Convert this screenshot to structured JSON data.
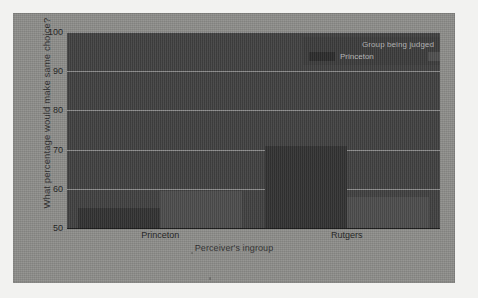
{
  "chart_data": {
    "type": "bar",
    "title": "",
    "xlabel": "Perceiver's ingroup",
    "ylabel": "What percentage would make same choice?",
    "categories": [
      "Princeton",
      "Rutgers"
    ],
    "series": [
      {
        "name": "Princeton",
        "values": [
          55,
          71
        ],
        "color": "#2a2a2a"
      },
      {
        "name": "Rutgers",
        "values": [
          59.5,
          58
        ],
        "color": "#474747"
      }
    ],
    "ylim": [
      50,
      100
    ],
    "yticks": [
      100,
      90,
      80,
      70,
      60,
      50
    ],
    "ytick_labels": [
      "100",
      "90",
      "80",
      "70",
      "60",
      "50"
    ],
    "grid": true,
    "legend_position": "top-right",
    "legend_title": "Group being judged"
  },
  "axes": {
    "y_title": "What percentage would make same choice?",
    "x_title": "Perceiver's ingroup"
  },
  "legend": {
    "title": "Group being judged",
    "entries": [
      {
        "label": "Princeton"
      },
      {
        "label": "Rutgers"
      }
    ]
  }
}
